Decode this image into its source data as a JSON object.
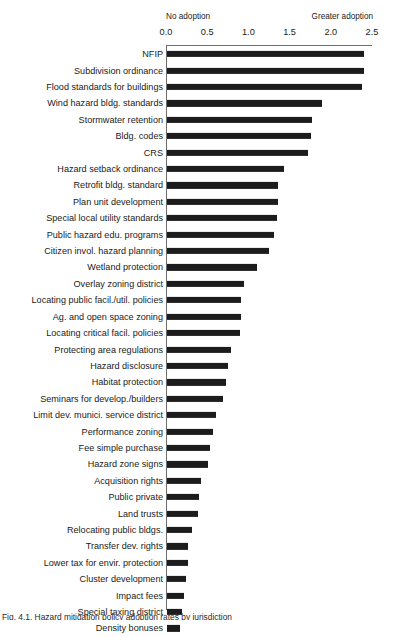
{
  "chart_data": {
    "type": "bar",
    "orientation": "horizontal",
    "title": "",
    "xlabel": "",
    "ylabel": "",
    "xlim": [
      0.0,
      2.5
    ],
    "grid": false,
    "legend": null,
    "annotations": {
      "left": "No adoption",
      "right": "Greater adoption"
    },
    "xticks": [
      {
        "value": 0.0,
        "label": "0.0"
      },
      {
        "value": 0.5,
        "label": "0.5"
      },
      {
        "value": 1.0,
        "label": "1.0"
      },
      {
        "value": 1.5,
        "label": "1.5"
      },
      {
        "value": 2.0,
        "label": "2.0"
      },
      {
        "value": 2.5,
        "label": "2.5"
      }
    ],
    "bar_color": "#1c1c1c",
    "axis_color": "#6e6e6e",
    "categories": [
      "NFIP",
      "Subdivision ordinance",
      "Flood standards for buildings",
      "Wind hazard bldg. standards",
      "Stormwater retention",
      "Bldg. codes",
      "CRS",
      "Hazard setback ordinance",
      "Retrofit bldg. standard",
      "Plan unit development",
      "Special local utility standards",
      "Public hazard edu. programs",
      "Citizen invol. hazard planning",
      "Wetland protection",
      "Overlay zoning district",
      "Locating public facil./util. policies",
      "Ag. and open space zoning",
      "Locating critical facil. policies",
      "Protecting area regulations",
      "Hazard disclosure",
      "Habitat protection",
      "Seminars for develop./builders",
      "Limit dev. munici. service district",
      "Performance zoning",
      "Fee simple purchase",
      "Hazard zone signs",
      "Acquisition rights",
      "Public private",
      "Land trusts",
      "Relocating public bldgs.",
      "Transfer dev. rights",
      "Lower tax for envir. protection",
      "Cluster development",
      "Impact fees",
      "Special taxing district",
      "Density bonuses"
    ],
    "values": [
      2.39,
      2.39,
      2.37,
      1.88,
      1.76,
      1.75,
      1.71,
      1.42,
      1.35,
      1.35,
      1.34,
      1.3,
      1.24,
      1.09,
      0.93,
      0.9,
      0.9,
      0.88,
      0.78,
      0.74,
      0.71,
      0.68,
      0.6,
      0.56,
      0.52,
      0.5,
      0.41,
      0.39,
      0.38,
      0.3,
      0.26,
      0.25,
      0.23,
      0.21,
      0.18,
      0.16
    ]
  },
  "caption": {
    "text": "Fig. 4.1.  Hazard mitigation policy adoption rates by jurisdiction"
  }
}
